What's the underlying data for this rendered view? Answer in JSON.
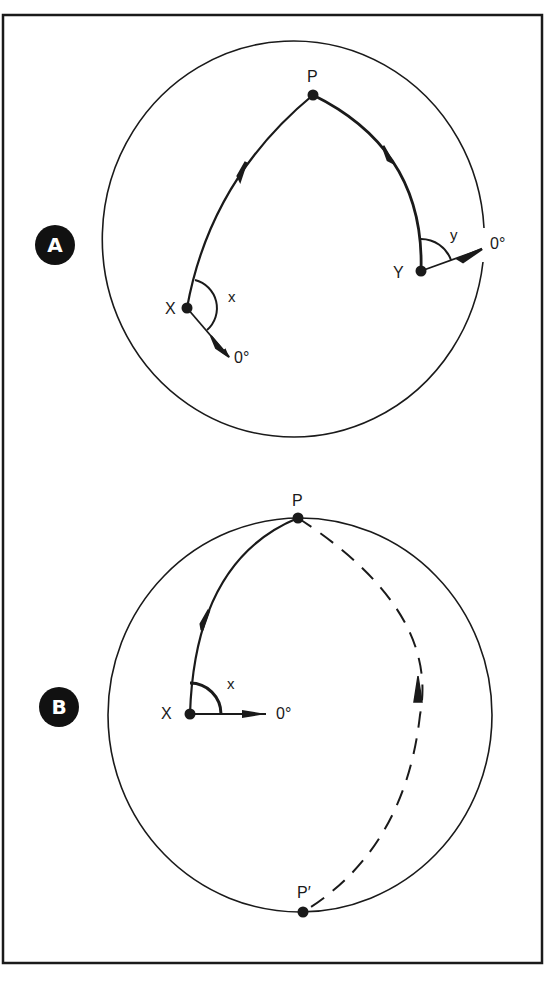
{
  "figure": {
    "panels": [
      {
        "badge": "A",
        "points": {
          "pole": "P",
          "start": "X",
          "end": "Y"
        },
        "angle_labels": {
          "at_start": "x",
          "at_end": "y"
        },
        "reference_labels": {
          "at_start": "0°",
          "at_end": "0°"
        }
      },
      {
        "badge": "B",
        "points": {
          "pole": "P",
          "antipode": "P′",
          "start": "X"
        },
        "angle_labels": {
          "at_start": "x"
        },
        "reference_labels": {
          "at_start": "0°"
        }
      }
    ],
    "colors": {
      "ink": "#1a1a1a",
      "background": "#ffffff"
    }
  }
}
